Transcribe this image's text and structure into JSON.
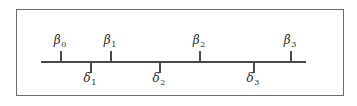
{
  "figure": {
    "type": "number-line",
    "border_color": "#6b6b6b",
    "line_color": "#4a4a4a",
    "text_color": "#2a2a2a",
    "background": "#ffffff",
    "axis": {
      "start_x": 41,
      "end_x": 306,
      "y": 61
    },
    "beta_marks": [
      {
        "symbol": "β",
        "subscript": "0",
        "label": "β0",
        "x": 60,
        "direction": "up"
      },
      {
        "symbol": "β",
        "subscript": "1",
        "label": "β1",
        "x": 110,
        "direction": "up"
      },
      {
        "symbol": "β",
        "subscript": "2",
        "label": "β2",
        "x": 199,
        "direction": "up"
      },
      {
        "symbol": "β",
        "subscript": "3",
        "label": "β3",
        "x": 290,
        "direction": "up"
      }
    ],
    "delta_marks": [
      {
        "symbol": "δ",
        "subscript": "1",
        "label": "δ1",
        "x": 90,
        "direction": "down"
      },
      {
        "symbol": "δ",
        "subscript": "2",
        "label": "δ2",
        "x": 159,
        "direction": "down"
      },
      {
        "symbol": "δ",
        "subscript": "3",
        "label": "δ3",
        "x": 253,
        "direction": "down"
      }
    ]
  }
}
